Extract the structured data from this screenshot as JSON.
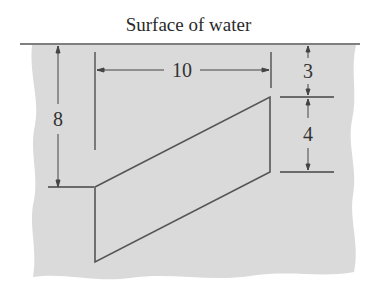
{
  "title": "Surface of water",
  "dimensions": {
    "depth_to_bottom": "8",
    "width": "10",
    "depth_to_top": "3",
    "vertical_height": "4"
  },
  "colors": {
    "water": "#d9d9d9",
    "lines": "#555555",
    "text": "#333333"
  }
}
